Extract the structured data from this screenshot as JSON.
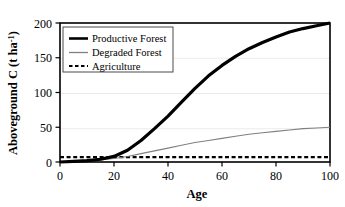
{
  "chart_data": {
    "type": "line",
    "title": "",
    "xlabel": "Age",
    "ylabel": "Aboveground C (t ha-1)",
    "ylabel_main": "Aboveground C (t ha",
    "ylabel_sup": "-1",
    "ylabel_tail": ")",
    "xlim": [
      0,
      100
    ],
    "ylim": [
      0,
      200
    ],
    "xticks": [
      "0",
      "20",
      "40",
      "60",
      "80",
      "100"
    ],
    "xtick_values": [
      0,
      20,
      40,
      60,
      80,
      100
    ],
    "yticks": [
      "0",
      "50",
      "100",
      "150",
      "200"
    ],
    "ytick_values": [
      0,
      50,
      100,
      150,
      200
    ],
    "grid": "horizontal-faint",
    "legend_position": "top-left-inside",
    "x": [
      0,
      5,
      10,
      15,
      20,
      25,
      30,
      35,
      40,
      45,
      50,
      55,
      60,
      65,
      70,
      75,
      80,
      85,
      90,
      95,
      100
    ],
    "series": [
      {
        "name": "Productive Forest",
        "color": "#000000",
        "style": "solid",
        "width": 3.2,
        "values": [
          0,
          1,
          2,
          4,
          8,
          17,
          31,
          48,
          66,
          86,
          106,
          124,
          139,
          152,
          163,
          172,
          180,
          187,
          192,
          196,
          200
        ]
      },
      {
        "name": "Degraded Forest",
        "color": "#808080",
        "style": "solid",
        "width": 1.1,
        "values": [
          0,
          1,
          2,
          3,
          5,
          8,
          12,
          16,
          20,
          24,
          28,
          31,
          34,
          37,
          40,
          42,
          44,
          46,
          48,
          49,
          50
        ]
      },
      {
        "name": "Agriculture",
        "color": "#000000",
        "style": "dashed",
        "width": 2.2,
        "constant": 7,
        "values": [
          7,
          7,
          7,
          7,
          7,
          7,
          7,
          7,
          7,
          7,
          7,
          7,
          7,
          7,
          7,
          7,
          7,
          7,
          7,
          7,
          7
        ]
      }
    ],
    "legend_entries": [
      {
        "label": "Productive Forest",
        "color": "#000000",
        "style": "solid"
      },
      {
        "label": "Degraded Forest",
        "color": "#808080",
        "style": "solid"
      },
      {
        "label": "Agriculture",
        "color": "#000000",
        "style": "dashed"
      }
    ]
  }
}
